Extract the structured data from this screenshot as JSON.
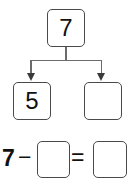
{
  "worksheet": {
    "type": "number-bond-with-equation",
    "number_bond": {
      "whole": "7",
      "parts": [
        {
          "label": "part-known",
          "value": "5"
        },
        {
          "label": "part-unknown",
          "value": ""
        }
      ],
      "arrows": 2
    },
    "equation": {
      "operand": "7",
      "minus": "−",
      "subtrahend": "",
      "equals": "=",
      "difference": ""
    }
  },
  "colors": {
    "background": "#ffffff",
    "box_border": "#4a4a4a",
    "connector": "#6b6b6b",
    "arrowhead": "#3a3a3a",
    "text": "#111111"
  }
}
